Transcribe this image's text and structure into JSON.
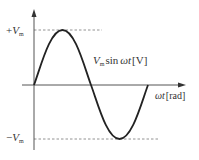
{
  "diagram": {
    "type": "sine-wave",
    "y_axis": {
      "max_label": {
        "sign": "+",
        "symbol": "V",
        "subscript": "m"
      },
      "min_label": {
        "sign": "−",
        "symbol": "V",
        "subscript": "m"
      }
    },
    "x_axis": {
      "label_var": "ωt",
      "label_unit": "[rad]"
    },
    "curve_label": {
      "amp_symbol": "V",
      "amp_subscript": "m",
      "func": "sin",
      "arg": "ωt",
      "unit": "[V]"
    },
    "colors": {
      "curve": "#222222",
      "axis": "#555555",
      "dashed": "#777777",
      "text": "#333333"
    }
  }
}
